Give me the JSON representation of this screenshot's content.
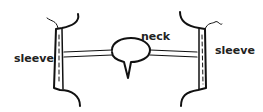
{
  "diagram": {
    "labels": {
      "left_sleeve": "sleeve",
      "neck": "neck",
      "right_sleeve": "sleeve"
    },
    "colors": {
      "line": "#111111",
      "background": "#ffffff"
    }
  }
}
